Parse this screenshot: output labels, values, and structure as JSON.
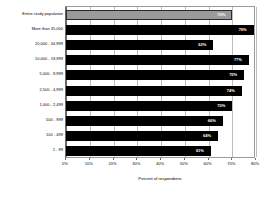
{
  "chart": {
    "type": "bar",
    "orientation": "horizontal",
    "xlabel": "Percent of respondents",
    "title": "",
    "ylabel": ""
  },
  "chart_data": {
    "type": "bar",
    "title": "",
    "xlabel": "Percent of respondents",
    "ylabel": "",
    "orientation": "horizontal",
    "xlim": [
      0,
      80
    ],
    "grid": true,
    "legend": null,
    "tick_labels": [
      "0%",
      "10%",
      "20%",
      "30%",
      "40%",
      "50%",
      "60%",
      "70%",
      "80%"
    ],
    "tick_values": [
      0,
      10,
      20,
      30,
      40,
      50,
      60,
      70,
      80
    ],
    "categories": [
      "Entire study population",
      "More than 35,000",
      "20,000 - 34,999",
      "10,000 - 19,999",
      "5,000 - 9,999",
      "2,500 - 4,999",
      "1,000 - 2,499",
      "500 - 999",
      "100 - 499",
      "1 - 99"
    ],
    "values": [
      70,
      79,
      62,
      77,
      75,
      74,
      70,
      66,
      64,
      61
    ],
    "value_labels": [
      "70%",
      "79%",
      "62%",
      "77%",
      "75%",
      "74%",
      "70%",
      "66%",
      "64%",
      "61%"
    ],
    "highlight_index": 0,
    "colors": {
      "bar": "#000000",
      "highlight_bar": "#9a9a9a",
      "value_text": "#ffffff",
      "gridline": "#bdbdbd",
      "axis": "#6b6b6b",
      "background": "#ffffff"
    }
  }
}
